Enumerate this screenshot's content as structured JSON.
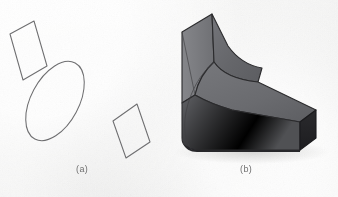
{
  "figure": {
    "panels": [
      {
        "id": "a",
        "label": "(a)",
        "description": "outline cross-sections"
      },
      {
        "id": "b",
        "label": "(b)",
        "description": "shaded solid"
      }
    ]
  },
  "colors": {
    "background": "#f3f3f2",
    "outline_stroke": "#6e6e70",
    "caption_text": "#6f6f6f",
    "face_top": "#5f6063",
    "face_left": "#75767a",
    "face_front": "#5a5b5e",
    "face_end_dark": "#232326",
    "face_upper_slab": "#6a6b6e",
    "edge_line": "#2b2b2d",
    "shadow": "#cfcfce"
  },
  "panel_a": {
    "shapes": [
      {
        "name": "parallelogram-upper-left",
        "type": "parallelogram",
        "points": "10,34 34,21 47,66 23,80"
      },
      {
        "name": "ellipse-center",
        "type": "ellipse",
        "cx": 55,
        "cy": 101,
        "rx": 24,
        "ry": 43,
        "rotation_deg": 28
      },
      {
        "name": "parallelogram-lower-right",
        "type": "parallelogram",
        "points": "113,121 137,104 150,142 126,158"
      }
    ]
  },
  "panel_b": {
    "solid": {
      "name": "lofted-solid",
      "faces": [
        {
          "name": "top-slab-face",
          "fill": "#6a6b6e"
        },
        {
          "name": "left-slab-face",
          "fill": "#7a7b7f"
        },
        {
          "name": "front-lower-face",
          "fill": "#5c5d60"
        },
        {
          "name": "top-lower-face",
          "fill": "#6e6f72"
        },
        {
          "name": "end-cap-face",
          "fill": "#232326"
        },
        {
          "name": "bottom-edge-face",
          "fill": "#2e2e31"
        }
      ]
    }
  }
}
